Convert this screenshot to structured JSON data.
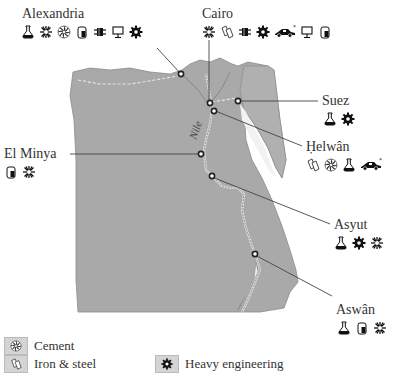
{
  "map": {
    "river_label": "Nile",
    "land_color": "#a9a9a9",
    "sea_color": "#ffffff",
    "water_color": "#e8e8e8"
  },
  "cities": [
    {
      "id": "alexandria",
      "name": "Alexandria",
      "icons": [
        "chemicals-icon",
        "textiles-icon",
        "cement-icon",
        "food-processing-icon",
        "electrical-icon",
        "electronics-icon",
        "heavy-engineering-icon"
      ]
    },
    {
      "id": "cairo",
      "name": "Cairo",
      "icons": [
        "textiles-icon",
        "iron-steel-icon",
        "electrical-icon",
        "heavy-engineering-icon",
        "car-assembly-icon",
        "electronics-icon",
        "food-processing-icon"
      ]
    },
    {
      "id": "suez",
      "name": "Suez",
      "icons": [
        "chemicals-icon",
        "heavy-engineering-icon"
      ]
    },
    {
      "id": "helwan",
      "name": "Ḥelwân",
      "icons": [
        "iron-steel-icon",
        "cement-icon",
        "chemicals-icon",
        "car-assembly-icon"
      ]
    },
    {
      "id": "elminya",
      "name": "El Minya",
      "icons": [
        "food-processing-icon",
        "textiles-icon"
      ]
    },
    {
      "id": "asyut",
      "name": "Asyut",
      "icons": [
        "chemicals-icon",
        "heavy-engineering-icon",
        "textiles-icon"
      ]
    },
    {
      "id": "aswan",
      "name": "Aswân",
      "icons": [
        "chemicals-icon",
        "food-processing-icon",
        "textiles-icon"
      ]
    }
  ],
  "legend": [
    {
      "icon": "cement-icon",
      "label": "Cement"
    },
    {
      "icon": "iron-steel-icon",
      "label": "Iron & steel"
    },
    {
      "icon": "heavy-engineering-icon",
      "label": "Heavy engineering"
    }
  ]
}
